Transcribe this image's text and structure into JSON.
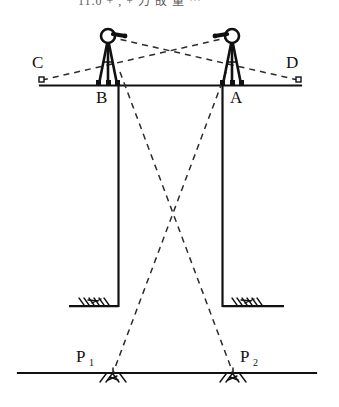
{
  "figure": {
    "type": "engineering-survey-diagram",
    "cropped_top_line": "11.0    +  ,  + 力 故 量    ⋯",
    "labels": {
      "left_backsight": "C",
      "right_backsight": "D",
      "left_station": "B",
      "right_station": "A",
      "lower_point_1": "P",
      "lower_point_1_sub": "1",
      "lower_point_2": "P",
      "lower_point_2_sub": "2"
    },
    "colors": {
      "ink": "#111111",
      "faded_ink": "#5a5a5a",
      "paper": "#ffffff",
      "dashed": "#333333"
    },
    "geometry": {
      "upper_surface_line": {
        "x1": 40,
        "y1": 85,
        "x2": 301,
        "y2": 85
      },
      "ground_line": {
        "x1": 18,
        "y1": 373,
        "x2": 316,
        "y2": 373
      },
      "left_shaft_wall_x": 118,
      "right_shaft_wall_x": 222,
      "shaft_bottom_y": 307,
      "left_instrument_x": 108,
      "right_instrument_x": 232,
      "crossing_point": {
        "x": 172,
        "y": 205
      },
      "plumb_point_1_x": 113,
      "plumb_point_2_x": 233
    }
  }
}
